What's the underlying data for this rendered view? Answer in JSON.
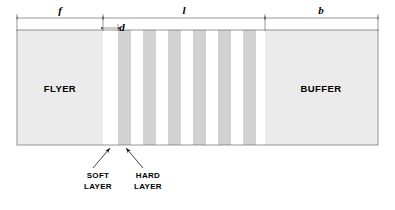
{
  "figure": {
    "type": "cross-section-schematic",
    "title_visible": false,
    "background_color": "#ffffff",
    "canvas": {
      "width": 395,
      "height": 210
    }
  },
  "colors": {
    "flyer_fill": "#ebebeb",
    "buffer_fill": "#ebebeb",
    "hard_layer_fill": "#d2d2d2",
    "soft_layer_fill": "#ffffff",
    "outline": "#6a6a6a",
    "dimension_line": "#555555",
    "text": "#000000"
  },
  "dimensions": [
    {
      "id": "f",
      "label": "f",
      "span": "flyer-width",
      "x_start": 17,
      "x_end": 103,
      "line_y": 18
    },
    {
      "id": "d",
      "label": "d",
      "span": "soft-layer-gap",
      "x_start": 103,
      "x_end": 118,
      "line_y": 28
    },
    {
      "id": "l",
      "label": "l",
      "span": "layered-stack-width",
      "x_start": 103,
      "x_end": 265,
      "line_y": 18
    },
    {
      "id": "b",
      "label": "b",
      "span": "buffer-width",
      "x_start": 265,
      "x_end": 378,
      "line_y": 18
    }
  ],
  "body": {
    "x": 17,
    "y": 30,
    "width": 361,
    "height": 115,
    "regions": [
      {
        "name": "flyer",
        "label": "FLYER",
        "x": 17,
        "width": 86,
        "fill": "#ebebeb"
      },
      {
        "name": "stack",
        "label": "",
        "x": 103,
        "width": 162,
        "fill": "#ffffff"
      },
      {
        "name": "buffer",
        "label": "BUFFER",
        "x": 265,
        "width": 113,
        "fill": "#ebebeb"
      }
    ]
  },
  "layers": {
    "hard_layer_count": 6,
    "hard_layer_width": 13,
    "period": 25,
    "first_hard_x": 118,
    "hard_layer_x_positions": [
      118,
      143,
      168,
      193,
      218,
      243
    ],
    "soft_layer_count": 6,
    "soft_layer_width": 12
  },
  "callouts": [
    {
      "id": "soft-layer",
      "label_line_1": "SOFT",
      "label_line_2": "LAYER",
      "text_x": 98,
      "text_y": 178,
      "arrow_from_x": 93,
      "arrow_from_y": 168,
      "arrow_to_x": 110,
      "arrow_to_y": 148
    },
    {
      "id": "hard-layer",
      "label_line_1": "HARD",
      "label_line_2": "LAYER",
      "text_x": 148,
      "text_y": 178,
      "arrow_from_x": 143,
      "arrow_from_y": 168,
      "arrow_to_x": 126,
      "arrow_to_y": 148
    }
  ]
}
